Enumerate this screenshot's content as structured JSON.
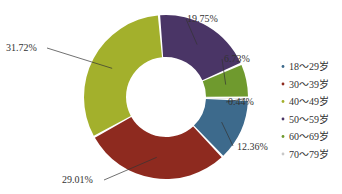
{
  "chart_data": {
    "type": "pie",
    "subtype": "donut",
    "title": "",
    "categories": [
      "18～29岁",
      "30～39岁",
      "40～49岁",
      "50～59岁",
      "60～69岁",
      "70～79岁"
    ],
    "values": [
      12.36,
      29.01,
      31.72,
      19.75,
      6.73,
      0.44
    ],
    "labels": [
      "12.36%",
      "29.01%",
      "31.72%",
      "19.75%",
      "6.73%",
      "0.44%"
    ],
    "colors": [
      "#3d6a8c",
      "#8e2a1f",
      "#a3b02c",
      "#4a3566",
      "#6f9a2e",
      "#c8c8c8"
    ],
    "legend_position": "right"
  },
  "legend": {
    "items": [
      "18～29岁",
      "30～39岁",
      "40～49岁",
      "50～59岁",
      "60～69岁",
      "70～79岁"
    ]
  }
}
